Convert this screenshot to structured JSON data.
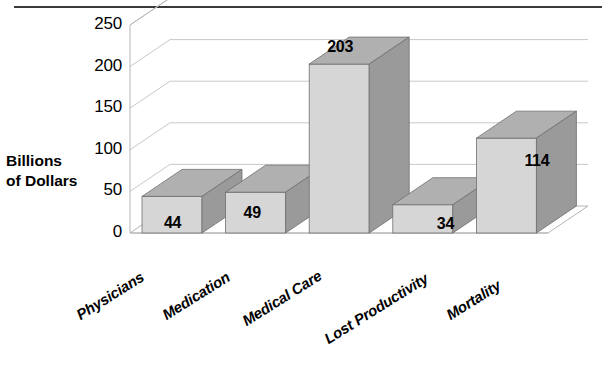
{
  "chart_data": {
    "type": "bar",
    "title": "",
    "subtitle": "",
    "xlabel": "",
    "ylabel": "Billions of Dollars",
    "ylabel_line1": "Billions",
    "ylabel_line2": "of Dollars",
    "categories": [
      "Physicians",
      "Medication",
      "Medical Care",
      "Lost Productivity",
      "Mortality"
    ],
    "values": [
      44,
      49,
      203,
      34,
      114
    ],
    "data_labels": [
      "44",
      "49",
      "203",
      "34",
      "114"
    ],
    "ylim": [
      0,
      250
    ],
    "ytick_labels": [
      "250",
      "200",
      "150",
      "100",
      "50",
      "0"
    ],
    "ytick_values": [
      250,
      200,
      150,
      100,
      50,
      0
    ],
    "grid": true,
    "legend": "none",
    "style_3d": true,
    "units": "Billions of Dollars"
  },
  "colors": {
    "bar_front": "#d6d6d6",
    "bar_top": "#b0b0b0",
    "bar_side": "#9a9a9a",
    "bar_edge": "#6f6f6f",
    "grid_line": "#c8c8c8",
    "axis_line": "#b4b4b4",
    "floor": "#ffffff",
    "top_rule": "#3a3a3a",
    "text": "#000000",
    "background": "#ffffff"
  },
  "geometry": {
    "plot_left": 130,
    "plot_right": 548,
    "baseline_y": 233,
    "top_y": 25,
    "depth_x": 40,
    "depth_y": -27,
    "bar_width": 60,
    "slot_width": 83.6
  }
}
